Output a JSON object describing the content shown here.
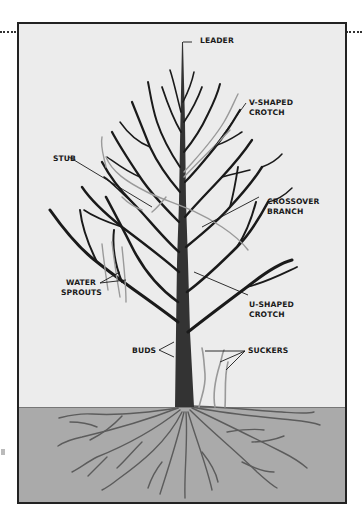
{
  "diagram": {
    "colors": {
      "background": "#ececec",
      "soil": "#aaaaaa",
      "trunk": "#333333",
      "branch": "#1a1a1a",
      "fault_branch": "#9a9a9a",
      "root": "#666666",
      "frame": "#222222"
    },
    "labels": {
      "leader": "LEADER",
      "v_crotch_1": "V-SHAPED",
      "v_crotch_2": "CROTCH",
      "stub": "STUB",
      "crossover_1": "CROSSOVER",
      "crossover_2": "BRANCH",
      "water_1": "WATER",
      "water_2": "SPROUTS",
      "u_crotch_1": "U-SHAPED",
      "u_crotch_2": "CROTCH",
      "buds": "BUDS",
      "suckers": "SUCKERS"
    }
  }
}
